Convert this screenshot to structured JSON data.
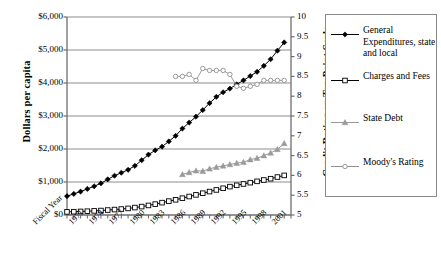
{
  "chart_data": {
    "type": "line",
    "title": "",
    "xlabel": "Fiscal Year",
    "ylabel": "Dollars per capita",
    "ylabel_right": "Credit Rating on Ten Point Scale",
    "grid": true,
    "legend_position": "right",
    "xlim": [
      1969,
      2002
    ],
    "ylim": [
      0,
      6000
    ],
    "ylim_right": [
      5,
      10
    ],
    "x_tick_labels": [
      "Fiscal Year",
      "1971",
      "1974",
      "1977",
      "1980",
      "1983",
      "1986",
      "1989",
      "1992",
      "1995",
      "1998",
      "2001"
    ],
    "x_tick_values": [
      1969,
      1971,
      1974,
      1977,
      1980,
      1983,
      1986,
      1989,
      1992,
      1995,
      1998,
      2001
    ],
    "y_tick_labels": [
      "$0",
      "$1,000",
      "$2,000",
      "$3,000",
      "$4,000",
      "$5,000",
      "$6,000"
    ],
    "y_tick_values": [
      0,
      1000,
      2000,
      3000,
      4000,
      5000,
      6000
    ],
    "y_right_tick_labels": [
      "5",
      "5.5",
      "6",
      "6.5",
      "7",
      "7.5",
      "8",
      "8.5",
      "9",
      "9.5",
      "10"
    ],
    "y_right_tick_values": [
      5,
      5.5,
      6,
      6.5,
      7,
      7.5,
      8,
      8.5,
      9,
      9.5,
      10
    ],
    "series": [
      {
        "name": "General Expenditures, state and local",
        "axis": "left",
        "marker": "filled-diamond",
        "color": "#000000",
        "x": [
          1969,
          1970,
          1971,
          1972,
          1973,
          1974,
          1975,
          1976,
          1977,
          1978,
          1979,
          1980,
          1981,
          1982,
          1983,
          1984,
          1985,
          1986,
          1987,
          1988,
          1989,
          1990,
          1991,
          1992,
          1993,
          1994,
          1995,
          1996,
          1997,
          1998,
          1999,
          2000,
          2001
        ],
        "values": [
          570,
          640,
          710,
          790,
          870,
          960,
          1080,
          1190,
          1280,
          1370,
          1490,
          1660,
          1830,
          1960,
          2070,
          2230,
          2400,
          2620,
          2800,
          2980,
          3180,
          3390,
          3580,
          3720,
          3830,
          3960,
          4080,
          4210,
          4340,
          4520,
          4720,
          4980,
          5230
        ]
      },
      {
        "name": "Charges and Fees",
        "axis": "left",
        "marker": "open-square",
        "color": "#000000",
        "x": [
          1969,
          1970,
          1971,
          1972,
          1973,
          1974,
          1975,
          1976,
          1977,
          1978,
          1979,
          1980,
          1981,
          1982,
          1983,
          1984,
          1985,
          1986,
          1987,
          1988,
          1989,
          1990,
          1991,
          1992,
          1993,
          1994,
          1995,
          1996,
          1997,
          1998,
          1999,
          2000,
          2001
        ],
        "values": [
          95,
          100,
          108,
          115,
          125,
          135,
          150,
          165,
          180,
          200,
          225,
          255,
          290,
          330,
          375,
          420,
          460,
          510,
          560,
          610,
          660,
          710,
          760,
          810,
          860,
          900,
          940,
          980,
          1020,
          1060,
          1100,
          1150,
          1200
        ]
      },
      {
        "name": "State Debt",
        "axis": "left",
        "marker": "filled-triangle",
        "color": "#9a9a9a",
        "x": [
          1986,
          1987,
          1988,
          1989,
          1990,
          1991,
          1992,
          1993,
          1994,
          1995,
          1996,
          1997,
          1998,
          1999,
          2000,
          2001
        ],
        "values": [
          1230,
          1290,
          1340,
          1330,
          1400,
          1450,
          1490,
          1530,
          1570,
          1600,
          1680,
          1720,
          1800,
          1880,
          1990,
          2170
        ]
      },
      {
        "name": "Moody's Rating",
        "axis": "right",
        "marker": "open-circle",
        "color": "#8f8f8f",
        "x": [
          1985,
          1986,
          1987,
          1988,
          1989,
          1990,
          1991,
          1992,
          1993,
          1994,
          1995,
          1996,
          1997,
          1998,
          1999,
          2000,
          2001
        ],
        "values": [
          8.5,
          8.5,
          8.55,
          8.4,
          8.7,
          8.65,
          8.65,
          8.65,
          8.55,
          8.25,
          8.2,
          8.25,
          8.3,
          8.4,
          8.4,
          8.4,
          8.4
        ]
      }
    ]
  },
  "legend": {
    "items": [
      {
        "label": "General Expenditures, state and local",
        "marker": "filled-diamond",
        "color": "#000000"
      },
      {
        "label": "Charges and Fees",
        "marker": "open-square",
        "color": "#000000"
      },
      {
        "label": "State Debt",
        "marker": "filled-triangle",
        "color": "#9a9a9a"
      },
      {
        "label": "Moody's Rating",
        "marker": "open-circle",
        "color": "#8f8f8f"
      }
    ]
  }
}
